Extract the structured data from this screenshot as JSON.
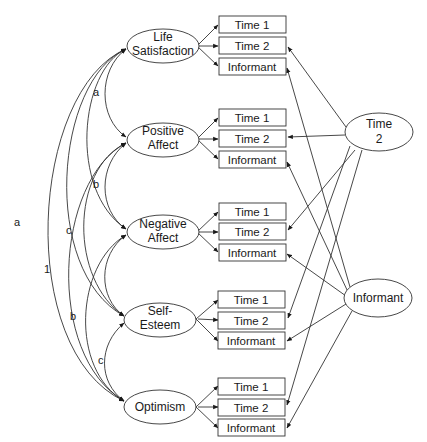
{
  "diagram": {
    "type": "structural-equation-model",
    "latent_factors": [
      {
        "id": "ls",
        "line1": "Life",
        "line2": "Satisfaction"
      },
      {
        "id": "pa",
        "line1": "Positive",
        "line2": "Affect"
      },
      {
        "id": "na",
        "line1": "Negative",
        "line2": "Affect"
      },
      {
        "id": "se",
        "line1": "Self-",
        "line2": "Esteem"
      },
      {
        "id": "op",
        "line1": "Optimism",
        "line2": ""
      }
    ],
    "indicators": [
      "Time 1",
      "Time 2",
      "Informant"
    ],
    "method_factors": [
      {
        "id": "t2",
        "line1": "Time",
        "line2": "2"
      },
      {
        "id": "inf",
        "line1": "Informant",
        "line2": ""
      }
    ],
    "covariance_labels": {
      "ls_pa": "a",
      "pa_na": "b",
      "ls_op": "a",
      "pa_op_left": "c",
      "ls_se": "1",
      "na_op": "b",
      "se_op": "c"
    }
  }
}
